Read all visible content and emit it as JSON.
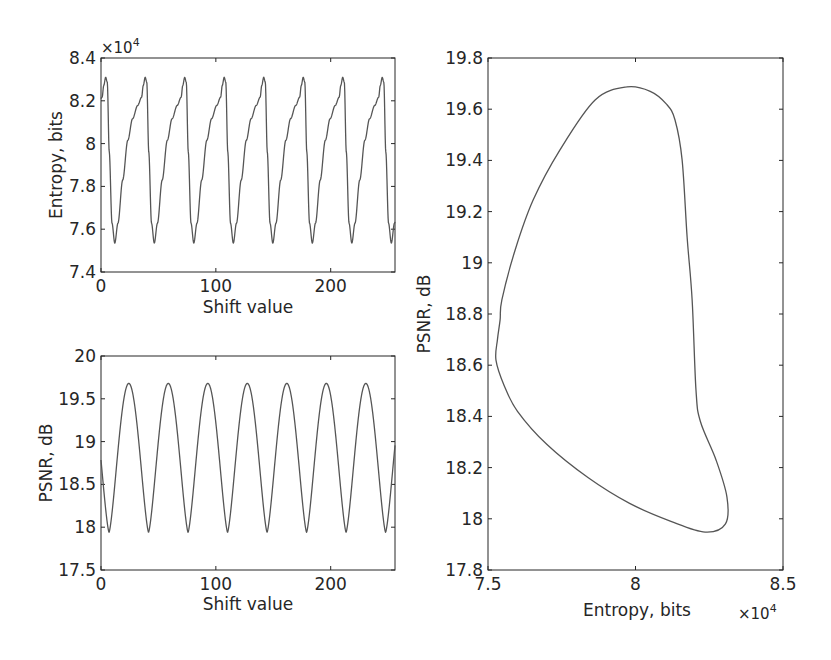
{
  "chart_data": [
    {
      "id": "entropy-vs-shift",
      "type": "line",
      "title": "",
      "xlabel": "Shift value",
      "ylabel": "Entropy, bits",
      "y_exponent_label": "×10^4",
      "xlim": [
        0,
        256
      ],
      "ylim": [
        7.4,
        8.4
      ],
      "xticks": [
        0,
        100,
        200
      ],
      "yticks": [
        7.4,
        7.6,
        7.8,
        8.0,
        8.2,
        8.4
      ],
      "ytick_labels": [
        "7.4",
        "7.6",
        "7.8",
        "8",
        "8.2",
        "8.4"
      ],
      "xtick_labels": [
        "0",
        "100",
        "200"
      ],
      "grid": false,
      "period_approx": 34.4,
      "peak_value_approx": 8.31,
      "trough_value_approx": 7.535,
      "peaks_x_approx": [
        4,
        39,
        74,
        108,
        143,
        177,
        212,
        248
      ],
      "troughs_x_approx": [
        12,
        47,
        81,
        116,
        150,
        185,
        219
      ],
      "series": [
        {
          "name": "Entropy",
          "unit": "bits (×10^4)",
          "color": "#555555"
        }
      ]
    },
    {
      "id": "psnr-vs-shift",
      "type": "line",
      "title": "",
      "xlabel": "Shift value",
      "ylabel": "PSNR, dB",
      "xlim": [
        0,
        256
      ],
      "ylim": [
        17.5,
        20
      ],
      "xticks": [
        0,
        100,
        200
      ],
      "yticks": [
        17.5,
        18,
        18.5,
        19,
        19.5,
        20
      ],
      "ytick_labels": [
        "17.5",
        "18",
        "18.5",
        "19",
        "19.5",
        "20"
      ],
      "xtick_labels": [
        "0",
        "100",
        "200"
      ],
      "grid": false,
      "period_approx": 34.4,
      "peak_value_approx": 19.68,
      "trough_value_approx": 17.94,
      "peaks_x_approx": [
        23,
        58,
        92,
        126,
        161,
        195,
        230
      ],
      "troughs_x_approx": [
        7,
        42,
        76,
        110,
        145,
        179,
        214,
        250
      ],
      "series": [
        {
          "name": "PSNR",
          "unit": "dB",
          "color": "#555555"
        }
      ]
    },
    {
      "id": "psnr-vs-entropy",
      "type": "line",
      "title": "",
      "xlabel": "Entropy, bits",
      "ylabel": "PSNR, dB",
      "x_exponent_label": "×10^4",
      "xlim": [
        7.5,
        8.5
      ],
      "ylim": [
        17.8,
        19.8
      ],
      "xticks": [
        7.5,
        8.0,
        8.5
      ],
      "xtick_labels": [
        "7.5",
        "8",
        "8.5"
      ],
      "yticks": [
        17.8,
        18.0,
        18.2,
        18.4,
        18.6,
        18.8,
        19.0,
        19.2,
        19.4,
        19.6,
        19.8
      ],
      "ytick_labels": [
        "17.8",
        "18",
        "18.2",
        "18.4",
        "18.6",
        "18.8",
        "19",
        "19.2",
        "19.4",
        "19.6",
        "19.8"
      ],
      "grid": false,
      "series": [
        {
          "name": "PSNR vs Entropy (closed loop)",
          "color": "#555555",
          "x": [
            7.971,
            8.05,
            8.105,
            8.134,
            8.158,
            8.175,
            8.192,
            8.205,
            8.22,
            8.273,
            8.31,
            8.305,
            8.236,
            8.12,
            7.98,
            7.84,
            7.7,
            7.6,
            7.555,
            7.527,
            7.532,
            7.541,
            7.547,
            7.592,
            7.653,
            7.744,
            7.863,
            7.971
          ],
          "y": [
            19.687,
            19.67,
            19.62,
            19.558,
            19.402,
            19.1,
            18.855,
            18.503,
            18.38,
            18.23,
            18.085,
            17.98,
            17.948,
            17.99,
            18.06,
            18.16,
            18.29,
            18.42,
            18.52,
            18.62,
            18.7,
            18.777,
            18.855,
            19.05,
            19.245,
            19.441,
            19.636,
            19.687
          ]
        }
      ]
    }
  ]
}
